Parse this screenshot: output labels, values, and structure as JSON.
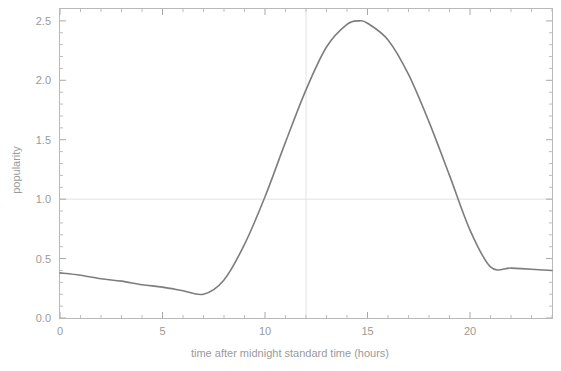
{
  "chart_data": {
    "type": "line",
    "title": "",
    "xlabel": "time after midnight standard time (hours)",
    "ylabel": "popularity",
    "xlim": [
      0,
      24
    ],
    "ylim": [
      0,
      2.6
    ],
    "xticks": [
      0,
      5,
      10,
      15,
      20
    ],
    "xtick_labels": [
      "0",
      "5",
      "10",
      "15",
      "20"
    ],
    "yticks": [
      0.0,
      0.5,
      1.0,
      1.5,
      2.0,
      2.5
    ],
    "ytick_labels": [
      "0.0",
      "0.5",
      "1.0",
      "1.5",
      "2.0",
      "2.5"
    ],
    "grid": true,
    "gridlines": {
      "horizontal": [
        1.0
      ],
      "vertical": [
        12
      ]
    },
    "legend": null,
    "line_color": "#7d7d7d",
    "frame_color": "#b9b9b9",
    "text_color": "#9a9a9a",
    "series": [
      {
        "name": "popularity",
        "x": [
          0,
          1,
          2,
          3,
          4,
          5,
          6,
          7,
          8,
          9,
          10,
          11,
          12,
          13,
          14,
          14.6,
          15,
          16,
          17,
          18,
          19,
          20,
          21,
          22,
          23,
          24
        ],
        "values": [
          0.38,
          0.36,
          0.33,
          0.31,
          0.28,
          0.26,
          0.23,
          0.2,
          0.32,
          0.62,
          1.02,
          1.48,
          1.92,
          2.28,
          2.47,
          2.5,
          2.48,
          2.34,
          2.05,
          1.65,
          1.2,
          0.74,
          0.43,
          0.42,
          0.41,
          0.4
        ]
      }
    ],
    "annotations": {
      "peak_x": 14.6,
      "peak_y": 2.5,
      "min_x": 7.0,
      "min_y": 0.2,
      "start_y": 0.38,
      "end_y": 0.4,
      "plateau_level": 0.42
    }
  },
  "axes": {
    "x_axis_name": "x-axis",
    "y_axis_name": "y-axis"
  }
}
